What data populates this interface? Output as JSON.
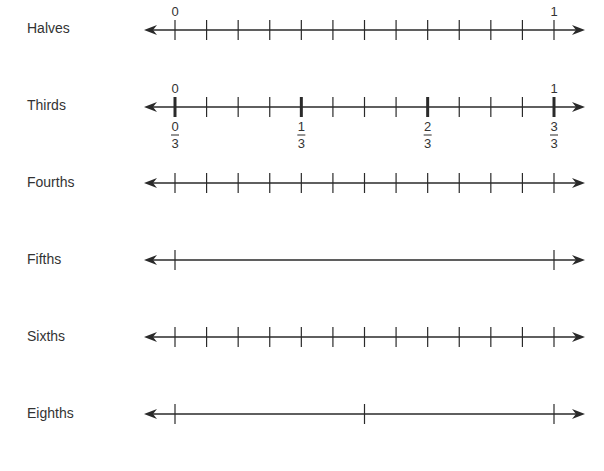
{
  "chart_data": {
    "type": "number-lines",
    "title": "",
    "tick_range": [
      0,
      1
    ],
    "lines": [
      {
        "label": "Halves",
        "y": 30,
        "ticks": 13,
        "end_labels_top": [
          "0",
          "1"
        ],
        "bold_ticks": [],
        "fractions_below": []
      },
      {
        "label": "Thirds",
        "y": 107,
        "ticks": 13,
        "end_labels_top": [
          "0",
          "1"
        ],
        "bold_ticks": [
          0,
          4,
          8,
          12
        ],
        "fractions_below": [
          {
            "tick": 0,
            "num": "0",
            "den": "3"
          },
          {
            "tick": 4,
            "num": "1",
            "den": "3"
          },
          {
            "tick": 8,
            "num": "2",
            "den": "3"
          },
          {
            "tick": 12,
            "num": "3",
            "den": "3"
          }
        ]
      },
      {
        "label": "Fourths",
        "y": 183,
        "ticks": 13,
        "end_labels_top": [],
        "bold_ticks": [],
        "fractions_below": []
      },
      {
        "label": "Fifths",
        "y": 260,
        "ticks": 2,
        "end_labels_top": [],
        "bold_ticks": [],
        "fractions_below": []
      },
      {
        "label": "Sixths",
        "y": 337,
        "ticks": 13,
        "end_labels_top": [],
        "bold_ticks": [],
        "fractions_below": []
      },
      {
        "label": "Eighths",
        "y": 414,
        "ticks": 3,
        "end_labels_top": [],
        "bold_ticks": [],
        "fractions_below": []
      }
    ],
    "x_start": 175,
    "x_end": 554,
    "arrow_left": 144,
    "arrow_right": 585
  },
  "labels": {
    "halves": "Halves",
    "thirds": "Thirds",
    "fourths": "Fourths",
    "fifths": "Fifths",
    "sixths": "Sixths",
    "eighths": "Eighths"
  },
  "colors": {
    "line": "#2a2a2a",
    "text": "#333333",
    "background": "#ffffff"
  }
}
